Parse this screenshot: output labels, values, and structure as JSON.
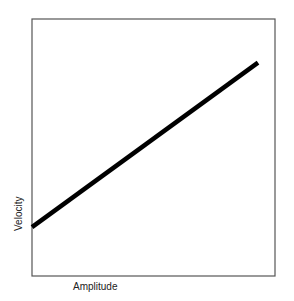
{
  "chart_data": {
    "type": "line",
    "title": "",
    "xlabel": "Amplitude",
    "ylabel": "Velocity",
    "grid": false,
    "legend": null,
    "ticks": false,
    "series": [
      {
        "name": "Velocity vs Amplitude",
        "x": [
          0.0,
          0.93
        ],
        "y": [
          0.19,
          0.83
        ]
      }
    ],
    "xlim": [
      0,
      1
    ],
    "ylim": [
      0,
      1
    ],
    "line_color": "#000000"
  }
}
